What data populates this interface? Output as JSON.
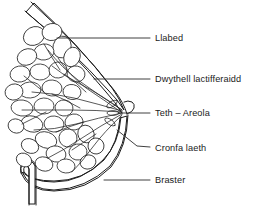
{
  "figure": {
    "language": "Welsh",
    "background_color": "#ffffff",
    "ink_color": "#1c1c1c",
    "text_color": "#1a1a1a",
    "style": "stippled line drawing"
  },
  "labels": [
    {
      "id": "llabed",
      "text": "Llabed",
      "text_x": 155,
      "text_y": 41,
      "leader": "M57,38 L150,38",
      "icon": "leader-line-icon"
    },
    {
      "id": "dwythell",
      "text": "Dwythell lactifferaidd",
      "text_x": 155,
      "text_y": 82,
      "leader": "M94,79 L150,79",
      "icon": "leader-line-icon"
    },
    {
      "id": "teth-areola",
      "text": "Teth – Areola",
      "text_x": 155,
      "text_y": 116,
      "leader": "M118,113 L150,113",
      "icon": "leader-line-icon"
    },
    {
      "id": "cronfa-laeth",
      "text": "Cronfa laeth",
      "text_x": 155,
      "text_y": 151,
      "leader": "M117,130 L137,146 L150,147",
      "icon": "leader-line-icon"
    },
    {
      "id": "braster",
      "text": "Braster",
      "text_x": 155,
      "text_y": 183,
      "leader": "M104,180 L150,180",
      "icon": "leader-line-icon"
    }
  ]
}
